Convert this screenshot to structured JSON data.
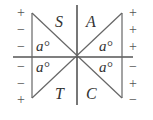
{
  "diagram": {
    "quadrant_labels": {
      "top_left": "S",
      "top_right": "A",
      "bottom_left": "T",
      "bottom_right": "C"
    },
    "angle_label": "a°",
    "left_signs": [
      "+",
      "−",
      "−",
      "−",
      "−",
      "+"
    ],
    "right_signs": [
      "+",
      "+",
      "+",
      "−",
      "+",
      "−"
    ],
    "colors": {
      "line": "#555555",
      "text": "#333333"
    }
  }
}
